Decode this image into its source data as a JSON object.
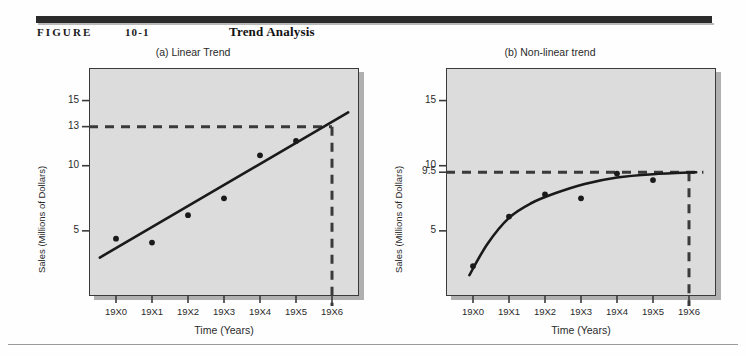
{
  "header": {
    "figure_label": "FIGURE",
    "figure_number": "10-1",
    "title": "Trend Analysis"
  },
  "chart_data": [
    {
      "type": "scatter",
      "panel_id": "a",
      "title": "(a) Linear Trend",
      "xlabel": "Time (Years)",
      "ylabel": "Sales (Millions of Dollars)",
      "categories": [
        "19X0",
        "19X1",
        "19X2",
        "19X3",
        "19X4",
        "19X5",
        "19X6"
      ],
      "x": [
        0,
        1,
        2,
        3,
        4,
        5
      ],
      "values": [
        4.4,
        4.1,
        6.2,
        7.5,
        10.8,
        11.9
      ],
      "ytick_labels": [
        "15",
        "13",
        "10",
        "5"
      ],
      "ytick_values": [
        15,
        13,
        10,
        5
      ],
      "ylim": [
        0,
        17.5
      ],
      "xlim": [
        -0.75,
        6.75
      ],
      "grid": false,
      "legend": "none",
      "series": [
        {
          "name": "Observed sales",
          "kind": "points",
          "values": [
            4.4,
            4.1,
            6.2,
            7.5,
            10.8,
            11.9
          ]
        },
        {
          "name": "Linear trend line",
          "kind": "line",
          "x_start": -0.45,
          "y_start": 2.95,
          "x_end": 6.45,
          "y_end": 14.1
        }
      ],
      "annotations": [
        {
          "name": "forecast-horizontal-dashed",
          "kind": "dashed-horizontal",
          "y": 13,
          "x_from": -0.75,
          "x_to": 6
        },
        {
          "name": "forecast-vertical-dashed",
          "kind": "dashed-vertical",
          "x": 6,
          "y_from": 13,
          "y_to": 0
        }
      ],
      "forecast": {
        "year": "19X6",
        "value": 13
      }
    },
    {
      "type": "scatter",
      "panel_id": "b",
      "title": "(b)  Non-linear trend",
      "xlabel": "Time (Years)",
      "ylabel": "Sales (Millions of Dollars)",
      "categories": [
        "19X0",
        "19X1",
        "19X2",
        "19X3",
        "19X4",
        "19X5",
        "19X6"
      ],
      "x": [
        0,
        1,
        2,
        3,
        4,
        5
      ],
      "values": [
        2.3,
        6.1,
        7.8,
        7.5,
        9.4,
        8.9
      ],
      "ytick_labels": [
        "15",
        "10",
        "9.5",
        "5"
      ],
      "ytick_values": [
        15,
        10,
        9.5,
        5
      ],
      "ylim": [
        0,
        17.5
      ],
      "xlim": [
        -0.75,
        6.75
      ],
      "grid": false,
      "legend": "none",
      "series": [
        {
          "name": "Observed sales",
          "kind": "points",
          "values": [
            2.3,
            6.1,
            7.8,
            7.5,
            9.4,
            8.9
          ]
        },
        {
          "name": "Non-linear trend curve",
          "kind": "curve",
          "asymptote": 9.5,
          "points": [
            {
              "x": -0.1,
              "y": 1.6
            },
            {
              "x": 0.4,
              "y": 4.0
            },
            {
              "x": 1.0,
              "y": 6.0
            },
            {
              "x": 1.6,
              "y": 7.1
            },
            {
              "x": 2.3,
              "y": 7.9
            },
            {
              "x": 3.1,
              "y": 8.6
            },
            {
              "x": 4.0,
              "y": 9.1
            },
            {
              "x": 5.0,
              "y": 9.35
            },
            {
              "x": 6.2,
              "y": 9.5
            }
          ]
        }
      ],
      "annotations": [
        {
          "name": "forecast-horizontal-dashed",
          "kind": "dashed-horizontal",
          "y": 9.5,
          "x_from": -0.75,
          "x_to": 6.4
        },
        {
          "name": "forecast-vertical-dashed",
          "kind": "dashed-vertical",
          "x": 6,
          "y_from": 9.5,
          "y_to": 0
        }
      ],
      "forecast": {
        "year": "19X6",
        "value": 9.5
      }
    }
  ]
}
